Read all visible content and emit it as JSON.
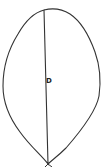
{
  "diagram": {
    "shape": "leaf-outline",
    "label": "D",
    "stroke_color": "#333333",
    "fill_color": "#ffffff"
  }
}
